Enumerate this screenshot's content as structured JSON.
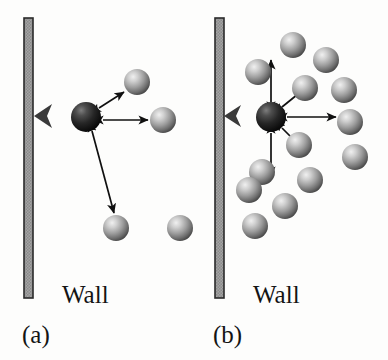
{
  "figure": {
    "background_color": "#fdfdfc",
    "width": 388,
    "height": 360
  },
  "colors": {
    "wall_border": "#2a2a2a",
    "wall_fill": "#9a9a9a",
    "sphere_light": "#e8e8e8",
    "sphere_mid": "#8f8f8f",
    "sphere_dark": "#4a4a4a",
    "center_sphere_dark": "#1a1a1a",
    "arrow_stroke": "#101010",
    "motion_arrow": "#3a3a3a",
    "text": "#141414"
  },
  "panels": [
    {
      "id": "a",
      "caption": "(a)",
      "wall_label": "Wall",
      "wall": {
        "x": 24,
        "y": 18,
        "width": 9,
        "height": 280
      },
      "center_particle": {
        "cx": 86,
        "cy": 117,
        "r": 15
      },
      "motion_arrow": {
        "x1": 72,
        "y1": 116,
        "x2": 36,
        "y2": 116,
        "label": "wall-directed-motion"
      },
      "neighbor_spheres": [
        {
          "cx": 137,
          "cy": 82,
          "r": 13
        },
        {
          "cx": 163,
          "cy": 120,
          "r": 13
        },
        {
          "cx": 116,
          "cy": 228,
          "r": 13
        },
        {
          "cx": 180,
          "cy": 228,
          "r": 13
        }
      ],
      "interaction_arrows": [
        {
          "x1": 99,
          "y1": 108,
          "x2": 124,
          "y2": 92,
          "double": true
        },
        {
          "x1": 103,
          "y1": 120,
          "x2": 148,
          "y2": 120,
          "double": true
        },
        {
          "x1": 92,
          "y1": 131,
          "x2": 114,
          "y2": 213,
          "double": false
        }
      ],
      "sphere_count": 5
    },
    {
      "id": "b",
      "caption": "(b)",
      "wall_label": "Wall",
      "wall": {
        "x": 215,
        "y": 18,
        "width": 9,
        "height": 280
      },
      "center_particle": {
        "cx": 271,
        "cy": 117,
        "r": 15
      },
      "motion_arrow": {
        "x1": 257,
        "y1": 116,
        "x2": 224,
        "y2": 116,
        "label": "wall-directed-motion"
      },
      "neighbor_spheres": [
        {
          "cx": 293,
          "cy": 45,
          "r": 13
        },
        {
          "cx": 326,
          "cy": 60,
          "r": 13
        },
        {
          "cx": 258,
          "cy": 72,
          "r": 13
        },
        {
          "cx": 305,
          "cy": 88,
          "r": 13
        },
        {
          "cx": 344,
          "cy": 90,
          "r": 13
        },
        {
          "cx": 350,
          "cy": 122,
          "r": 13
        },
        {
          "cx": 299,
          "cy": 145,
          "r": 13
        },
        {
          "cx": 355,
          "cy": 157,
          "r": 13
        },
        {
          "cx": 262,
          "cy": 172,
          "r": 13
        },
        {
          "cx": 310,
          "cy": 180,
          "r": 13
        },
        {
          "cx": 249,
          "cy": 190,
          "r": 13
        },
        {
          "cx": 285,
          "cy": 206,
          "r": 13
        },
        {
          "cx": 255,
          "cy": 226,
          "r": 13
        }
      ],
      "interaction_arrows": [
        {
          "x1": 271,
          "y1": 102,
          "x2": 271,
          "y2": 60,
          "double": true
        },
        {
          "x1": 282,
          "y1": 107,
          "x2": 303,
          "y2": 90,
          "double": true
        },
        {
          "x1": 287,
          "y1": 117,
          "x2": 336,
          "y2": 117,
          "double": true
        },
        {
          "x1": 282,
          "y1": 128,
          "x2": 300,
          "y2": 146,
          "double": true
        },
        {
          "x1": 271,
          "y1": 133,
          "x2": 271,
          "y2": 176,
          "double": true
        }
      ],
      "sphere_count": 14
    }
  ]
}
